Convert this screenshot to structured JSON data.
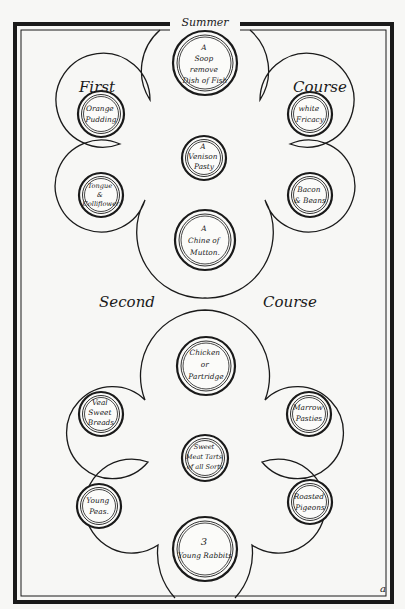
{
  "page": {
    "title": "Summer",
    "page_mark": "a",
    "colors": {
      "paper": "#f7f7f5",
      "ink": "#1a1a1a"
    }
  },
  "first_course": {
    "label_left": "First",
    "label_right": "Course",
    "dishes": [
      {
        "position": "top-center",
        "lines": [
          "A",
          "Soop",
          "remove",
          "Dish of Fish"
        ]
      },
      {
        "position": "upper-left",
        "lines": [
          "Orange",
          "Pudding"
        ]
      },
      {
        "position": "upper-right",
        "lines": [
          "white",
          "Fricacy"
        ]
      },
      {
        "position": "middle-center",
        "lines": [
          "A",
          "Venison",
          "Pasty"
        ]
      },
      {
        "position": "lower-left",
        "lines": [
          "Tongue",
          "&",
          "Colliflower"
        ]
      },
      {
        "position": "lower-right",
        "lines": [
          "Bacon",
          "& Beans"
        ]
      },
      {
        "position": "bottom-center",
        "lines": [
          "A",
          "Chine of",
          "Mutton."
        ]
      }
    ]
  },
  "second_course": {
    "label_left": "Second",
    "label_right": "Course",
    "dishes": [
      {
        "position": "top-center",
        "lines": [
          "Chicken",
          "or",
          "Partridge"
        ]
      },
      {
        "position": "upper-left",
        "lines": [
          "Veal",
          "Sweet",
          "Breads"
        ]
      },
      {
        "position": "upper-right",
        "lines": [
          "Marrow",
          "Pasties"
        ]
      },
      {
        "position": "middle-center",
        "lines": [
          "Sweet",
          "Meat Tarts",
          "of all Sorts"
        ]
      },
      {
        "position": "lower-left",
        "lines": [
          "Young",
          "Peas."
        ]
      },
      {
        "position": "lower-right",
        "lines": [
          "Roasted",
          "Pigeons"
        ]
      },
      {
        "position": "bottom-center",
        "lines": [
          "3",
          "Young Rabbits"
        ]
      }
    ]
  }
}
